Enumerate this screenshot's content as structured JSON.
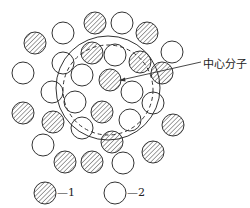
{
  "diagram": {
    "annotation": "中心分子",
    "legend": [
      {
        "kind": "hatched",
        "label": "—1"
      },
      {
        "kind": "open",
        "label": "—2"
      }
    ],
    "colors": {
      "stroke": "#333333",
      "fill": "#ffffff"
    },
    "molecules": [
      {
        "x": 95,
        "y": 23,
        "type": "hatched"
      },
      {
        "x": 122,
        "y": 23,
        "type": "open"
      },
      {
        "x": 63,
        "y": 33,
        "type": "open"
      },
      {
        "x": 147,
        "y": 33,
        "type": "hatched"
      },
      {
        "x": 35,
        "y": 43,
        "type": "hatched"
      },
      {
        "x": 172,
        "y": 52,
        "type": "open"
      },
      {
        "x": 92,
        "y": 53,
        "type": "hatched"
      },
      {
        "x": 115,
        "y": 55,
        "type": "open"
      },
      {
        "x": 140,
        "y": 62,
        "type": "hatched"
      },
      {
        "x": 63,
        "y": 63,
        "type": "open"
      },
      {
        "x": 23,
        "y": 73,
        "type": "open"
      },
      {
        "x": 162,
        "y": 73,
        "type": "hatched"
      },
      {
        "x": 82,
        "y": 75,
        "type": "open"
      },
      {
        "x": 110,
        "y": 80,
        "type": "hatched"
      },
      {
        "x": 52,
        "y": 92,
        "type": "open"
      },
      {
        "x": 132,
        "y": 92,
        "type": "open"
      },
      {
        "x": 75,
        "y": 102,
        "type": "open"
      },
      {
        "x": 153,
        "y": 103,
        "type": "open"
      },
      {
        "x": 23,
        "y": 113,
        "type": "hatched"
      },
      {
        "x": 102,
        "y": 112,
        "type": "hatched"
      },
      {
        "x": 130,
        "y": 120,
        "type": "open"
      },
      {
        "x": 53,
        "y": 122,
        "type": "hatched"
      },
      {
        "x": 173,
        "y": 125,
        "type": "hatched"
      },
      {
        "x": 82,
        "y": 128,
        "type": "open"
      },
      {
        "x": 43,
        "y": 145,
        "type": "open"
      },
      {
        "x": 112,
        "y": 142,
        "type": "hatched"
      },
      {
        "x": 153,
        "y": 152,
        "type": "hatched"
      },
      {
        "x": 65,
        "y": 162,
        "type": "hatched"
      },
      {
        "x": 92,
        "y": 162,
        "type": "hatched"
      },
      {
        "x": 123,
        "y": 163,
        "type": "open"
      }
    ]
  }
}
